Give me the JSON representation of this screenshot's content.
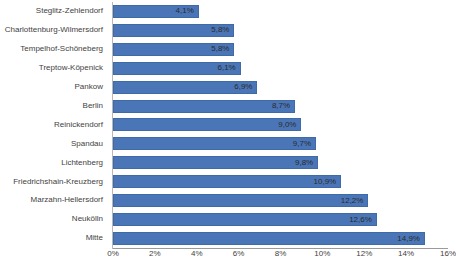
{
  "chart_data": {
    "type": "bar",
    "orientation": "horizontal",
    "title": "",
    "subtitle": "",
    "xlabel": "",
    "ylabel": "",
    "xlim": [
      0,
      16
    ],
    "xtick_step": 2,
    "grid": false,
    "legend": null,
    "value_suffix": "%",
    "decimal_separator": ",",
    "categories": [
      "Steglitz-Zehlendorf",
      "Charlottenburg-Wilmersdorf",
      "Tempelhof-Schöneberg",
      "Treptow-Köpenick",
      "Pankow",
      "Berlin",
      "Reinickendorf",
      "Spandau",
      "Lichtenberg",
      "Friedrichshain-Kreuzberg",
      "Marzahn-Hellersdorf",
      "Neukölln",
      "Mitte"
    ],
    "values": [
      4.1,
      5.8,
      5.8,
      6.1,
      6.9,
      8.7,
      9.0,
      9.7,
      9.8,
      10.9,
      12.2,
      12.6,
      14.9
    ],
    "data_labels": [
      "4,1%",
      "5,8%",
      "5,8%",
      "6,1%",
      "6,9%",
      "8,7%",
      "9,0%",
      "9,7%",
      "9,8%",
      "10,9%",
      "12,2%",
      "12,6%",
      "14,9%"
    ],
    "xtick_labels": [
      "0%",
      "2%",
      "4%",
      "6%",
      "8%",
      "10%",
      "12%",
      "14%",
      "16%"
    ],
    "xtick_values": [
      0,
      2,
      4,
      6,
      8,
      10,
      12,
      14,
      16
    ],
    "colors": {
      "bar_fill": "#4a76b8",
      "bar_border": "#3f6aa8",
      "axis_line": "#9a9a9a",
      "category_axis_line": "#b8b8b8",
      "text": "#3f3f3f",
      "data_label_text": "#2b2b2b",
      "background": "#ffffff"
    }
  }
}
